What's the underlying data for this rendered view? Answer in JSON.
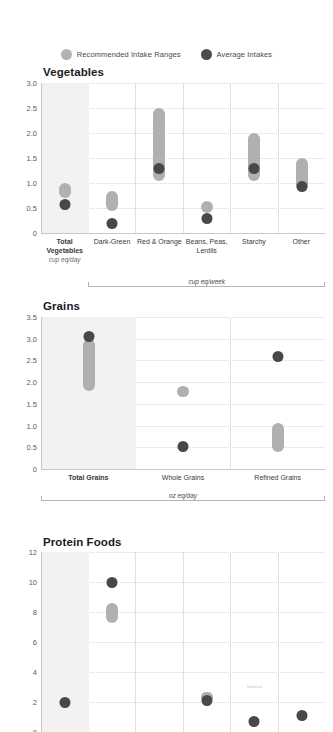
{
  "legend": {
    "items": [
      {
        "label": "Recommended Intake Ranges",
        "icon": "gray-circle-icon",
        "color": "#b3b3b3"
      },
      {
        "label": "Average Intakes",
        "icon": "dark-circle-icon",
        "color": "#4d4d4d"
      }
    ]
  },
  "chart_data": [
    {
      "type": "range-dot",
      "title": "Vegetables",
      "xlabel": "",
      "ylabel": "",
      "ylim": [
        0,
        3.0
      ],
      "yticks": [
        "0",
        "0.5",
        "1.0",
        "1.5",
        "2.0",
        "2.5",
        "3.0"
      ],
      "ytick_values": [
        0,
        0.5,
        1.0,
        1.5,
        2.0,
        2.5,
        3.0
      ],
      "grid": true,
      "legend_position": "top-center",
      "group_bracket": {
        "label": "cup eq/week",
        "from_column": 1,
        "to_column": 5
      },
      "categories": [
        {
          "label": "Total Vegetables",
          "unit": "cup eq/day",
          "bold": true,
          "shaded": true
        },
        {
          "label": "Dark-Green",
          "unit": "",
          "bold": false,
          "shaded": false
        },
        {
          "label": "Red & Orange",
          "unit": "",
          "bold": false,
          "shaded": false
        },
        {
          "label": "Beans, Peas, Lentils",
          "unit": "",
          "bold": false,
          "shaded": false
        },
        {
          "label": "Starchy",
          "unit": "",
          "bold": false,
          "shaded": false
        },
        {
          "label": "Other",
          "unit": "",
          "bold": false,
          "shaded": false
        }
      ],
      "ranges": [
        [
          0.7,
          1.0
        ],
        [
          0.45,
          0.85
        ],
        [
          1.05,
          2.5
        ],
        [
          0.4,
          0.65
        ],
        [
          1.05,
          2.0
        ],
        [
          0.85,
          1.5
        ]
      ],
      "averages": [
        0.58,
        0.2,
        1.3,
        0.3,
        1.3,
        0.93
      ]
    },
    {
      "type": "range-dot",
      "title": "Grains",
      "xlabel": "",
      "ylabel": "",
      "ylim": [
        0,
        3.5
      ],
      "yticks": [
        "0",
        "0.5",
        "1.0",
        "1.5",
        "2.0",
        "2.5",
        "3.0",
        "3.5"
      ],
      "ytick_values": [
        0,
        0.5,
        1.0,
        1.5,
        2.0,
        2.5,
        3.0,
        3.5
      ],
      "grid": true,
      "group_bracket": {
        "label": "oz eq/day",
        "from_column": 0,
        "to_column": 2
      },
      "categories": [
        {
          "label": "Total Grains",
          "unit": "",
          "bold": true,
          "shaded": true
        },
        {
          "label": "Whole Grains",
          "unit": "",
          "bold": false,
          "shaded": false
        },
        {
          "label": "Refined Grains",
          "unit": "",
          "bold": false,
          "shaded": false
        }
      ],
      "ranges": [
        [
          1.8,
          3.0
        ],
        [
          1.65,
          1.9
        ],
        [
          0.4,
          1.05
        ]
      ],
      "averages": [
        3.05,
        0.52,
        2.58
      ]
    },
    {
      "type": "range-dot",
      "title": "Protein Foods",
      "xlabel": "",
      "ylabel": "",
      "ylim": [
        0,
        12
      ],
      "yticks": [
        "0",
        "2",
        "4",
        "6",
        "8",
        "10",
        "12"
      ],
      "ytick_values": [
        0,
        2,
        4,
        6,
        8,
        10,
        12
      ],
      "grid": true,
      "clipped_bottom": true,
      "categories": [
        {
          "label": "",
          "unit": "",
          "bold": true,
          "shaded": true
        },
        {
          "label": "",
          "unit": "",
          "bold": false,
          "shaded": false
        },
        {
          "label": "",
          "unit": "",
          "bold": false,
          "shaded": false
        },
        {
          "label": "",
          "unit": "",
          "bold": false,
          "shaded": false
        },
        {
          "label": "",
          "unit": "",
          "bold": false,
          "shaded": false
        },
        {
          "label": "",
          "unit": "",
          "bold": false,
          "shaded": false
        }
      ],
      "ranges": [
        null,
        [
          7.3,
          8.6
        ],
        null,
        [
          2.15,
          2.7
        ],
        null,
        null
      ],
      "averages": [
        2.0,
        10.0,
        null,
        2.1,
        0.7,
        1.1
      ],
      "faint_note": {
        "column": 4,
        "value": 3.0,
        "text": "National"
      }
    }
  ]
}
